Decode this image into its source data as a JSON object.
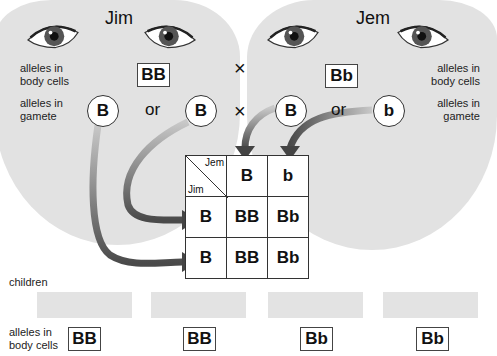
{
  "parents": {
    "left": {
      "name": "Jim",
      "genotype": "BB",
      "gametes": [
        "B",
        "B"
      ]
    },
    "right": {
      "name": "Jem",
      "genotype": "Bb",
      "gametes": [
        "B",
        "b"
      ]
    }
  },
  "labels": {
    "body_cells_line1": "alleles in",
    "body_cells_line2": "body cells",
    "gamete_line1": "alleles in",
    "gamete_line2": "gamete",
    "or": "or",
    "cross": "×",
    "children": "children"
  },
  "punnett": {
    "corner_top": "Jem",
    "corner_bottom": "Jim",
    "col_headers": [
      "B",
      "b"
    ],
    "row_headers": [
      "B",
      "B"
    ],
    "cells": [
      [
        "BB",
        "Bb"
      ],
      [
        "BB",
        "Bb"
      ]
    ]
  },
  "children": [
    {
      "genotype": "BB"
    },
    {
      "genotype": "BB"
    },
    {
      "genotype": "Bb"
    },
    {
      "genotype": "Bb"
    }
  ],
  "colors": {
    "face": "#e2e2e2",
    "arrow": "#555555",
    "iris": "#555555"
  }
}
